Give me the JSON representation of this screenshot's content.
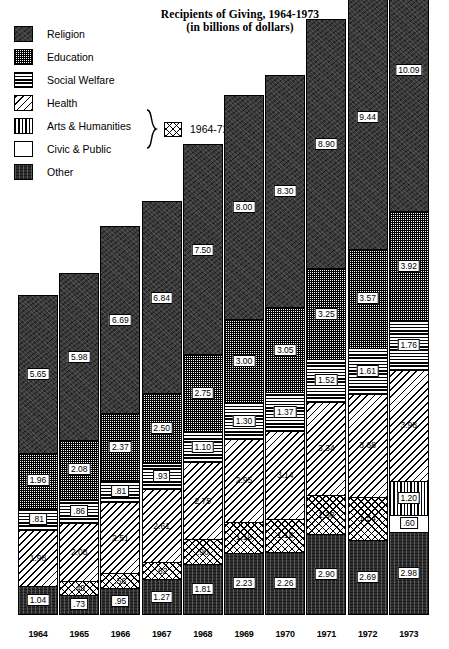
{
  "title": {
    "line1": "Recipients of Giving, 1964-1973",
    "line2": "(in billions of dollars)"
  },
  "legend": {
    "items": [
      {
        "label": "Religion",
        "key": "religion",
        "pattern": "solid-dark-mottled"
      },
      {
        "label": "Education",
        "key": "education",
        "pattern": "fine-checker"
      },
      {
        "label": "Social Welfare",
        "key": "social",
        "pattern": "horizontal-lines"
      },
      {
        "label": "Health",
        "key": "health",
        "pattern": "diagonal-hatch"
      },
      {
        "label": "Arts & Humanities",
        "key": "arts",
        "pattern": "vertical-lines"
      },
      {
        "label": "Civic & Public",
        "key": "civic",
        "pattern": "white-blank"
      },
      {
        "label": "Other",
        "key": "other",
        "pattern": "dark-vertical-mottled"
      }
    ],
    "combined_note": {
      "years": "1964-72",
      "pattern": "cross-hatch",
      "brace_covers": [
        "Arts & Humanities",
        "Civic & Public"
      ]
    }
  },
  "chart_data": {
    "type": "bar",
    "stacked": true,
    "title": "Recipients of Giving, 1964-1973 (in billions of dollars)",
    "xlabel": "",
    "ylabel": "",
    "units": "billions of dollars",
    "grid": false,
    "legend_position": "top-left",
    "categories": [
      "1964",
      "1965",
      "1966",
      "1967",
      "1968",
      "1969",
      "1970",
      "1971",
      "1972",
      "1973"
    ],
    "series_order_bottom_to_top": [
      "Other",
      "Arts & Humanities + Civic & Public",
      "Health",
      "Social Welfare",
      "Education",
      "Religion"
    ],
    "series": [
      {
        "name": "Religion",
        "key": "religion",
        "values": [
          5.65,
          5.98,
          6.69,
          6.84,
          7.5,
          8.0,
          8.3,
          8.9,
          9.44,
          10.09
        ]
      },
      {
        "name": "Education",
        "key": "education",
        "values": [
          1.96,
          2.08,
          2.37,
          2.5,
          2.75,
          3.0,
          3.05,
          3.25,
          3.57,
          3.92
        ]
      },
      {
        "name": "Social Welfare",
        "key": "social",
        "values": [
          0.81,
          0.86,
          0.81,
          0.93,
          1.1,
          1.3,
          1.37,
          1.52,
          1.61,
          1.76
        ]
      },
      {
        "name": "Health",
        "key": "health",
        "values": [
          1.98,
          2.08,
          2.51,
          2.61,
          2.75,
          2.95,
          3.14,
          3.34,
          3.68,
          3.98
        ]
      },
      {
        "name": "Arts & Humanities",
        "key": "arts",
        "values": [
          null,
          null,
          null,
          null,
          null,
          null,
          null,
          null,
          null,
          1.2
        ]
      },
      {
        "name": "Civic & Public",
        "key": "civic",
        "values": [
          null,
          null,
          null,
          null,
          null,
          null,
          null,
          null,
          null,
          0.6
        ]
      },
      {
        "name": "Arts & Humanities + Civic & Public",
        "key": "combo",
        "values": [
          null,
          0.49,
          0.56,
          0.62,
          0.9,
          1.1,
          1.18,
          1.38,
          1.54,
          null
        ]
      },
      {
        "name": "Other",
        "key": "other",
        "values": [
          1.04,
          0.73,
          0.95,
          1.27,
          1.81,
          2.23,
          2.26,
          2.9,
          2.69,
          2.98
        ]
      }
    ]
  },
  "bars": [
    {
      "year": "1964",
      "segments": [
        {
          "key": "religion",
          "label": "5.65",
          "value": 5.65
        },
        {
          "key": "education",
          "label": "1.96",
          "value": 1.96
        },
        {
          "key": "social",
          "label": ".81",
          "value": 0.81
        },
        {
          "key": "health",
          "label": "1.98",
          "value": 1.98
        },
        {
          "key": "other",
          "label": "1.04",
          "value": 1.04
        }
      ]
    },
    {
      "year": "1965",
      "segments": [
        {
          "key": "religion",
          "label": "5.98",
          "value": 5.98
        },
        {
          "key": "education",
          "label": "2.08",
          "value": 2.08
        },
        {
          "key": "social",
          "label": ".86",
          "value": 0.86
        },
        {
          "key": "health",
          "label": "2.08",
          "value": 2.08
        },
        {
          "key": "combo",
          "label": ".49",
          "value": 0.49
        },
        {
          "key": "other",
          "label": ".73",
          "value": 0.73
        }
      ]
    },
    {
      "year": "1966",
      "segments": [
        {
          "key": "religion",
          "label": "6.69",
          "value": 6.69
        },
        {
          "key": "education",
          "label": "2.37",
          "value": 2.37
        },
        {
          "key": "social",
          "label": ".81",
          "value": 0.81
        },
        {
          "key": "health",
          "label": "2.51",
          "value": 2.51
        },
        {
          "key": "combo",
          "label": ".56",
          "value": 0.56
        },
        {
          "key": "other",
          "label": ".95",
          "value": 0.95
        }
      ]
    },
    {
      "year": "1967",
      "segments": [
        {
          "key": "religion",
          "label": "6.84",
          "value": 6.84
        },
        {
          "key": "education",
          "label": "2.50",
          "value": 2.5
        },
        {
          "key": "social",
          "label": ".93",
          "value": 0.93
        },
        {
          "key": "health",
          "label": "2.61",
          "value": 2.61
        },
        {
          "key": "combo",
          "label": ".62",
          "value": 0.62
        },
        {
          "key": "other",
          "label": "1.27",
          "value": 1.27
        }
      ]
    },
    {
      "year": "1968",
      "segments": [
        {
          "key": "religion",
          "label": "7.50",
          "value": 7.5
        },
        {
          "key": "education",
          "label": "2.75",
          "value": 2.75
        },
        {
          "key": "social",
          "label": "1.10",
          "value": 1.1
        },
        {
          "key": "health",
          "label": "2.75",
          "value": 2.75
        },
        {
          "key": "combo",
          "label": ".90",
          "value": 0.9
        },
        {
          "key": "other",
          "label": "1.81",
          "value": 1.81
        }
      ]
    },
    {
      "year": "1969",
      "segments": [
        {
          "key": "religion",
          "label": "8.00",
          "value": 8.0
        },
        {
          "key": "education",
          "label": "3.00",
          "value": 3.0
        },
        {
          "key": "social",
          "label": "1.30",
          "value": 1.3
        },
        {
          "key": "health",
          "label": "2.95",
          "value": 2.95
        },
        {
          "key": "combo",
          "label": "1.10",
          "value": 1.1
        },
        {
          "key": "other",
          "label": "2.23",
          "value": 2.23
        }
      ]
    },
    {
      "year": "1970",
      "segments": [
        {
          "key": "religion",
          "label": "8.30",
          "value": 8.3
        },
        {
          "key": "education",
          "label": "3.05",
          "value": 3.05
        },
        {
          "key": "social",
          "label": "1.37",
          "value": 1.37
        },
        {
          "key": "health",
          "label": "3.14",
          "value": 3.14
        },
        {
          "key": "combo",
          "label": "1.18",
          "value": 1.18
        },
        {
          "key": "other",
          "label": "2.26",
          "value": 2.26
        }
      ]
    },
    {
      "year": "1971",
      "segments": [
        {
          "key": "religion",
          "label": "8.90",
          "value": 8.9
        },
        {
          "key": "education",
          "label": "3.25",
          "value": 3.25
        },
        {
          "key": "social",
          "label": "1.52",
          "value": 1.52
        },
        {
          "key": "health",
          "label": "3.34",
          "value": 3.34
        },
        {
          "key": "combo",
          "label": "1.38",
          "value": 1.38
        },
        {
          "key": "other",
          "label": "2.90",
          "value": 2.9
        }
      ]
    },
    {
      "year": "1972",
      "segments": [
        {
          "key": "religion",
          "label": "9.44",
          "value": 9.44
        },
        {
          "key": "education",
          "label": "3.57",
          "value": 3.57
        },
        {
          "key": "social",
          "label": "1.61",
          "value": 1.61
        },
        {
          "key": "health",
          "label": "3.68",
          "value": 3.68
        },
        {
          "key": "combo",
          "label": "1.54",
          "value": 1.54
        },
        {
          "key": "other",
          "label": "2.69",
          "value": 2.69
        }
      ]
    },
    {
      "year": "1973",
      "segments": [
        {
          "key": "religion",
          "label": "10.09",
          "value": 10.09
        },
        {
          "key": "education",
          "label": "3.92",
          "value": 3.92
        },
        {
          "key": "social",
          "label": "1.76",
          "value": 1.76
        },
        {
          "key": "health",
          "label": "3.98",
          "value": 3.98
        },
        {
          "key": "arts",
          "label": "1.20",
          "value": 1.2
        },
        {
          "key": "civic",
          "label": ".60",
          "value": 0.6
        },
        {
          "key": "other",
          "label": "2.98",
          "value": 2.98
        }
      ]
    }
  ],
  "axis": {
    "x_labels": [
      "1964",
      "1965",
      "1966",
      "1967",
      "1968",
      "1969",
      "1970",
      "1971",
      "1972",
      "1973"
    ]
  },
  "colors": {
    "ink": "#000000",
    "paper": "#ffffff",
    "religion_fill": "#3b3b3b",
    "other_fill": "#2e2e2e"
  }
}
